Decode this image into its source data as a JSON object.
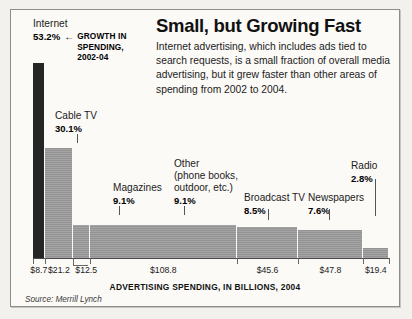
{
  "headline": "Small, but Growing Fast",
  "deck": "Internet advertising, which includes ads tied to search requests, is a small fraction of overall media advertising, but it grew faster than other areas of spending from 2002 to 2004.",
  "annotation": {
    "category": "Internet",
    "percent": "53.2%",
    "arrow_icon": "left-arrow-icon",
    "arrow_glyph": "←",
    "note": "GROWTH IN\nSPENDING,\n2002-04"
  },
  "axis_caption": "ADVERTISING SPENDING, IN BILLIONS, 2004",
  "source": "Source: Merrill Lynch",
  "colors": {
    "highlight_bar": "#252525",
    "bar": "#9b9b9b",
    "frame_bg": "#fbfaf7",
    "frame_border": "#8d8d8a",
    "page_bg": "#f2f1ee",
    "text": "#1b1b1b"
  },
  "chart_data": {
    "type": "bar",
    "title": "Small, but Growing Fast",
    "subtitle": "Internet advertising, which includes ads tied to search requests, is a small fraction of overall media advertising, but it grew faster than other areas of spending from 2002 to 2004.",
    "xlabel": "ADVERTISING SPENDING, IN BILLIONS, 2004",
    "ylabel": "GROWTH IN SPENDING, 2002-04",
    "note": "Bar width is proportional to 2004 advertising spending in billions of dollars; bar height is proportional to percent growth in spending from 2002 to 2004.",
    "source": "Source: Merrill Lynch",
    "grid": false,
    "legend": "none",
    "ylim": [
      0,
      53.2
    ],
    "value_unit": "billions of dollars",
    "height_unit": "percent growth",
    "categories": [
      "Internet",
      "Cable TV",
      "Magazines",
      "Other (phone books, outdoor, etc.)",
      "Broadcast TV",
      "Newspapers",
      "Radio"
    ],
    "series": [
      {
        "name": "Growth in spending, 2002-04 (%)",
        "values": [
          53.2,
          30.1,
          9.1,
          9.1,
          8.5,
          7.6,
          2.8
        ]
      },
      {
        "name": "Advertising spending, 2004 ($ billions)",
        "values": [
          8.7,
          21.2,
          12.5,
          108.8,
          45.6,
          47.8,
          19.4
        ]
      }
    ],
    "points": [
      {
        "label": "Internet",
        "label_lines": "Internet",
        "growth": "53.2%",
        "spending": "$8.7",
        "growth_value": 53.2,
        "spending_value": 8.7,
        "highlight": true
      },
      {
        "label": "Cable TV",
        "label_lines": "Cable TV",
        "growth": "30.1%",
        "spending": "$21.2",
        "growth_value": 30.1,
        "spending_value": 21.2,
        "highlight": false
      },
      {
        "label": "Magazines",
        "label_lines": "Magazines",
        "growth": "9.1%",
        "spending": "$12.5",
        "growth_value": 9.1,
        "spending_value": 12.5,
        "highlight": false
      },
      {
        "label": "Other (phone books, outdoor, etc.)",
        "label_lines": "Other\n(phone books,\noutdoor, etc.)",
        "growth": "9.1%",
        "spending": "$108.8",
        "growth_value": 9.1,
        "spending_value": 108.8,
        "highlight": false
      },
      {
        "label": "Broadcast TV",
        "label_lines": "Broadcast TV",
        "growth": "8.5%",
        "spending": "$45.6",
        "growth_value": 8.5,
        "spending_value": 45.6,
        "highlight": false
      },
      {
        "label": "Newspapers",
        "label_lines": "Newspapers",
        "growth": "7.6%",
        "spending": "$47.8",
        "growth_value": 7.6,
        "spending_value": 47.8,
        "highlight": false
      },
      {
        "label": "Radio",
        "label_lines": "Radio",
        "growth": "2.8%",
        "spending": "$19.4",
        "growth_value": 2.8,
        "spending_value": 19.4,
        "highlight": false
      }
    ]
  }
}
